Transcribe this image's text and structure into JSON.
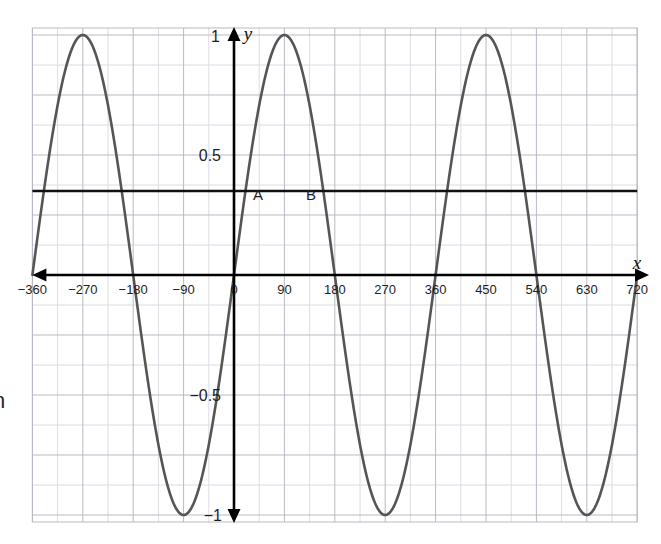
{
  "figure": {
    "axis_x_name": "x",
    "axis_y_name": "y",
    "margin_fragment": "n"
  },
  "labels": {
    "point_a": "A",
    "point_b": "B"
  },
  "colors": {
    "curve": "#555555",
    "axis": "#000000",
    "grid_major": "#b9b9c4",
    "grid_minor": "#dcdce4",
    "horizontal_line": "#111111",
    "background": "#ffffff"
  },
  "chart_data": {
    "type": "line",
    "title": "",
    "xlabel": "x",
    "ylabel": "y",
    "grid": true,
    "legend": null,
    "xlim": [
      -360,
      720
    ],
    "ylim": [
      -1.22,
      1.22
    ],
    "xticks": [
      -360,
      -270,
      -180,
      -90,
      0,
      90,
      180,
      270,
      360,
      450,
      540,
      630,
      720
    ],
    "xtick_labels": [
      "-360",
      "-270",
      "-180",
      "-90",
      "0",
      "90",
      "180",
      "270",
      "360",
      "450",
      "540",
      "630",
      "720"
    ],
    "yticks": [
      -1,
      -0.5,
      0.5,
      1
    ],
    "ytick_labels": [
      "-1",
      "-0.5",
      "0.5",
      "1"
    ],
    "x_tick_step_degrees": 90,
    "y_grid_step": 0.125,
    "series": [
      {
        "name": "y = sin(x)",
        "type": "line",
        "equation": "y = sin(x)",
        "amplitude": 1,
        "period_degrees": 360,
        "phase_degrees": 0,
        "color": "#555555",
        "maxima_x": [
          -270,
          90,
          450
        ],
        "minima_x": [
          -90,
          270,
          630
        ],
        "zeros_x": [
          -360,
          -180,
          0,
          180,
          360,
          540,
          720
        ],
        "points": [
          {
            "x": -360,
            "y": 0.0
          },
          {
            "x": -330,
            "y": 0.5
          },
          {
            "x": -300,
            "y": 0.866
          },
          {
            "x": -270,
            "y": 1.0
          },
          {
            "x": -240,
            "y": 0.866
          },
          {
            "x": -210,
            "y": 0.5
          },
          {
            "x": -180,
            "y": 0.0
          },
          {
            "x": -150,
            "y": -0.5
          },
          {
            "x": -120,
            "y": -0.866
          },
          {
            "x": -90,
            "y": -1.0
          },
          {
            "x": -60,
            "y": -0.866
          },
          {
            "x": -30,
            "y": -0.5
          },
          {
            "x": 0,
            "y": 0.0
          },
          {
            "x": 30,
            "y": 0.5
          },
          {
            "x": 60,
            "y": 0.866
          },
          {
            "x": 90,
            "y": 1.0
          },
          {
            "x": 120,
            "y": 0.866
          },
          {
            "x": 150,
            "y": 0.5
          },
          {
            "x": 180,
            "y": 0.0
          },
          {
            "x": 210,
            "y": -0.5
          },
          {
            "x": 240,
            "y": -0.866
          },
          {
            "x": 270,
            "y": -1.0
          },
          {
            "x": 300,
            "y": -0.866
          },
          {
            "x": 330,
            "y": -0.5
          },
          {
            "x": 360,
            "y": 0.0
          },
          {
            "x": 390,
            "y": 0.5
          },
          {
            "x": 420,
            "y": 0.866
          },
          {
            "x": 450,
            "y": 1.0
          },
          {
            "x": 480,
            "y": 0.866
          },
          {
            "x": 510,
            "y": 0.5
          },
          {
            "x": 540,
            "y": 0.0
          },
          {
            "x": 570,
            "y": -0.5
          },
          {
            "x": 600,
            "y": -0.866
          },
          {
            "x": 630,
            "y": -1.0
          },
          {
            "x": 660,
            "y": -0.866
          },
          {
            "x": 690,
            "y": -0.5
          },
          {
            "x": 720,
            "y": 0.0
          }
        ]
      },
      {
        "name": "horizontal reference line",
        "type": "hline",
        "y": 0.35,
        "color": "#111111",
        "x_from": -360,
        "x_to": 720
      }
    ],
    "annotations": [
      {
        "label": "A",
        "x": 20,
        "y": 0.35,
        "note": "first intersection of y = sin(x) with the horizontal line, right of the y-axis"
      },
      {
        "label": "B",
        "x": 160,
        "y": 0.35,
        "note": "second intersection of y = sin(x) with the horizontal line"
      }
    ]
  }
}
